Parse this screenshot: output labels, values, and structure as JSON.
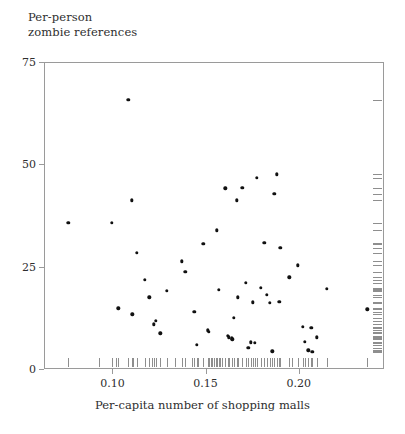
{
  "chart_data": {
    "type": "scatter",
    "title": "",
    "xlabel": "Per-capita number of shopping malls",
    "ylabel": "Per-person\nzombie references",
    "ylabel_line1": "Per-person",
    "ylabel_line2": "zombie references",
    "xlim": [
      0.0633,
      0.2457
    ],
    "ylim": [
      0,
      75
    ],
    "xticks": [
      0.1,
      0.15,
      0.2
    ],
    "xtick_labels": [
      "0.10",
      "0.15",
      "0.20"
    ],
    "yticks": [
      0,
      25,
      50,
      75
    ],
    "ytick_labels": [
      "0",
      "25",
      "50",
      "75"
    ],
    "grid": false,
    "legend": null,
    "marker_color": "#111111",
    "axis_color": "#9a9a9a",
    "rug_color": "#8e8e8e",
    "rug_x_enabled": true,
    "rug_y_enabled": true,
    "points": [
      {
        "x": 0.0758,
        "y": 36.0
      },
      {
        "x": 0.0992,
        "y": 35.9
      },
      {
        "x": 0.1027,
        "y": 15.1
      },
      {
        "x": 0.108,
        "y": 66.0
      },
      {
        "x": 0.1099,
        "y": 41.5
      },
      {
        "x": 0.1102,
        "y": 13.6
      },
      {
        "x": 0.1127,
        "y": 28.6
      },
      {
        "x": 0.117,
        "y": 22.0
      },
      {
        "x": 0.1193,
        "y": 17.8
      },
      {
        "x": 0.1218,
        "y": 11.2
      },
      {
        "x": 0.1226,
        "y": 12.0
      },
      {
        "x": 0.1252,
        "y": 9.0
      },
      {
        "x": 0.1285,
        "y": 19.3
      },
      {
        "x": 0.1367,
        "y": 26.6
      },
      {
        "x": 0.1386,
        "y": 24.0
      },
      {
        "x": 0.1433,
        "y": 14.2
      },
      {
        "x": 0.1449,
        "y": 6.1
      },
      {
        "x": 0.1483,
        "y": 30.9
      },
      {
        "x": 0.1505,
        "y": 9.7
      },
      {
        "x": 0.1512,
        "y": 9.3
      },
      {
        "x": 0.1556,
        "y": 34.1
      },
      {
        "x": 0.1565,
        "y": 19.6
      },
      {
        "x": 0.1601,
        "y": 44.4
      },
      {
        "x": 0.1613,
        "y": 8.3
      },
      {
        "x": 0.1619,
        "y": 8.0
      },
      {
        "x": 0.1634,
        "y": 7.7
      },
      {
        "x": 0.1638,
        "y": 7.5
      },
      {
        "x": 0.1646,
        "y": 12.8
      },
      {
        "x": 0.1661,
        "y": 41.5
      },
      {
        "x": 0.1668,
        "y": 17.8
      },
      {
        "x": 0.1692,
        "y": 44.5
      },
      {
        "x": 0.1709,
        "y": 21.3
      },
      {
        "x": 0.1724,
        "y": 5.4
      },
      {
        "x": 0.1736,
        "y": 6.8
      },
      {
        "x": 0.1747,
        "y": 16.5
      },
      {
        "x": 0.1759,
        "y": 6.6
      },
      {
        "x": 0.177,
        "y": 46.9
      },
      {
        "x": 0.179,
        "y": 20.1
      },
      {
        "x": 0.181,
        "y": 31.1
      },
      {
        "x": 0.1823,
        "y": 18.3
      },
      {
        "x": 0.184,
        "y": 16.4
      },
      {
        "x": 0.1852,
        "y": 4.6
      },
      {
        "x": 0.1863,
        "y": 43.0
      },
      {
        "x": 0.1878,
        "y": 47.8
      },
      {
        "x": 0.189,
        "y": 16.7
      },
      {
        "x": 0.1896,
        "y": 29.9
      },
      {
        "x": 0.1943,
        "y": 22.6
      },
      {
        "x": 0.1988,
        "y": 25.6
      },
      {
        "x": 0.2015,
        "y": 10.6
      },
      {
        "x": 0.2028,
        "y": 6.9
      },
      {
        "x": 0.2046,
        "y": 4.8
      },
      {
        "x": 0.2061,
        "y": 10.3
      },
      {
        "x": 0.2068,
        "y": 4.5
      },
      {
        "x": 0.2092,
        "y": 8.0
      },
      {
        "x": 0.2145,
        "y": 19.9
      },
      {
        "x": 0.2363,
        "y": 14.8
      }
    ],
    "rug_x_values": [
      0.0758,
      0.0925,
      0.0992,
      0.1012,
      0.1027,
      0.108,
      0.1099,
      0.1102,
      0.1107,
      0.1127,
      0.117,
      0.1193,
      0.1205,
      0.1218,
      0.1226,
      0.1252,
      0.1285,
      0.133,
      0.1367,
      0.1386,
      0.142,
      0.1433,
      0.1449,
      0.1455,
      0.1483,
      0.1505,
      0.1512,
      0.1522,
      0.153,
      0.1541,
      0.1548,
      0.1556,
      0.1565,
      0.1572,
      0.158,
      0.1601,
      0.1613,
      0.1619,
      0.1634,
      0.1638,
      0.1646,
      0.1661,
      0.1668,
      0.1692,
      0.1709,
      0.1724,
      0.1736,
      0.1747,
      0.1759,
      0.177,
      0.179,
      0.181,
      0.1823,
      0.184,
      0.1852,
      0.1863,
      0.1878,
      0.189,
      0.1896,
      0.1943,
      0.196,
      0.1988,
      0.2015,
      0.2028,
      0.2046,
      0.2061,
      0.2068,
      0.2092,
      0.2145,
      0.2363
    ],
    "rug_y_values": [
      66.0,
      47.8,
      46.9,
      44.5,
      44.4,
      43.0,
      41.5,
      41.5,
      36.0,
      35.9,
      34.1,
      31.1,
      30.9,
      29.9,
      28.6,
      26.6,
      25.6,
      24.0,
      22.6,
      22.0,
      21.3,
      20.1,
      19.9,
      19.6,
      19.3,
      18.3,
      17.8,
      17.8,
      16.7,
      16.5,
      16.4,
      15.1,
      14.8,
      14.2,
      13.6,
      12.8,
      12.0,
      11.2,
      10.6,
      10.3,
      9.7,
      9.3,
      9.0,
      8.3,
      8.0,
      8.0,
      7.7,
      7.5,
      6.9,
      6.8,
      6.6,
      6.1,
      5.4,
      4.8,
      4.6,
      4.5
    ]
  }
}
